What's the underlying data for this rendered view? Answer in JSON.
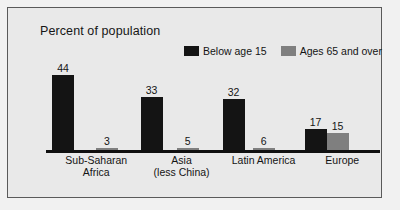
{
  "chart_data": {
    "type": "bar",
    "title": "Percent of population",
    "xlabel": "",
    "ylabel": "",
    "ylim": [
      0,
      48
    ],
    "grid": false,
    "legend_position": "top-right",
    "categories": [
      "Sub-Saharan Africa",
      "Asia (less China)",
      "Latin America",
      "Europe"
    ],
    "category_lines": [
      [
        "Sub-Saharan",
        "Africa"
      ],
      [
        "Asia",
        "(less China)"
      ],
      [
        "Latin America"
      ],
      [
        "Europe"
      ]
    ],
    "series": [
      {
        "name": "Below age 15",
        "color": "#141414",
        "values": [
          44,
          33,
          32,
          17
        ]
      },
      {
        "name": "Ages 65 and over",
        "color": "#7f7f7f",
        "values": [
          3,
          5,
          6,
          15
        ]
      }
    ]
  },
  "legend": {
    "items": [
      {
        "label": "Below age 15",
        "color": "#141414",
        "swatch": "legend-swatch-dark"
      },
      {
        "label": "Ages 65 and over",
        "color": "#7f7f7f",
        "swatch": "legend-swatch-gray"
      }
    ]
  },
  "colors": {
    "background": "#e9e9e9",
    "border": "#5a5a5a",
    "axis": "#101010",
    "text": "#141414",
    "series_primary": "#141414",
    "series_secondary": "#7f7f7f"
  }
}
